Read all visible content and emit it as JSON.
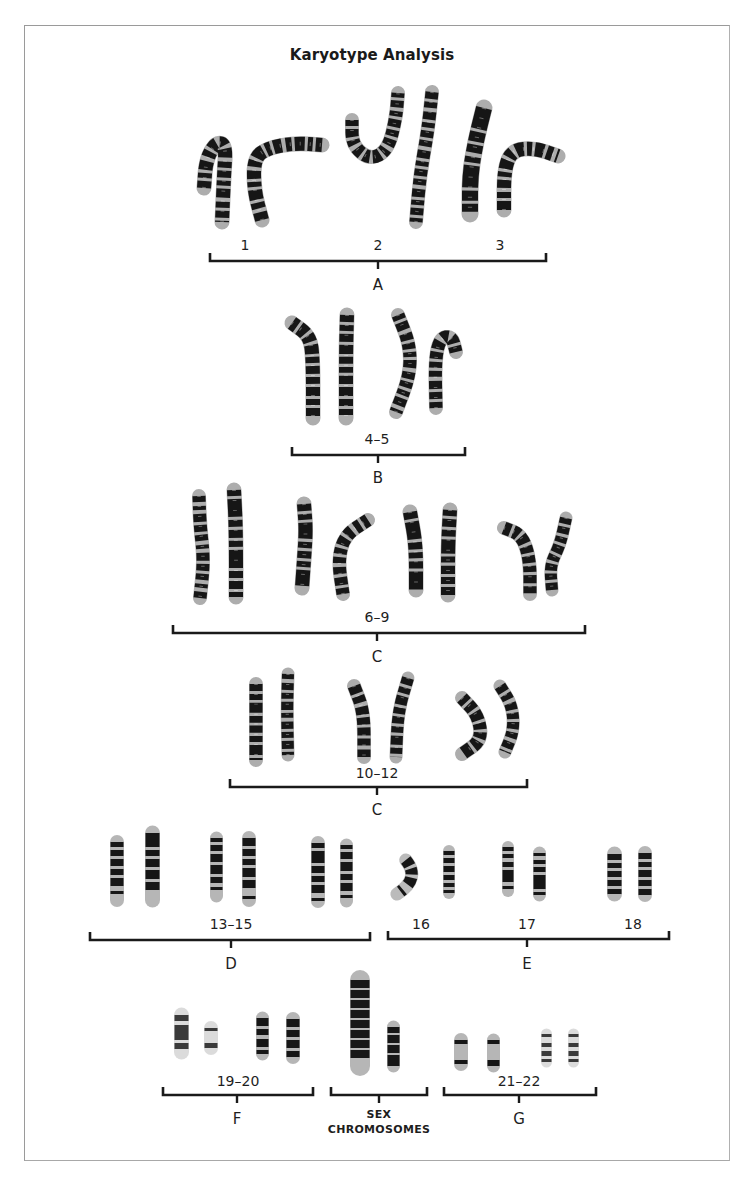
{
  "title": "Karyotype Analysis",
  "colors": {
    "ink": "#161616",
    "frame": "#9a9a9a",
    "background": "#ffffff",
    "light_band": "#d8d8d8"
  },
  "groups": [
    {
      "id": "A",
      "group_label": "A",
      "bracket": {
        "x1": 210,
        "x2": 546,
        "y": 261
      },
      "group_label_pos": {
        "x": 378,
        "y": 277
      },
      "sublabels": [
        {
          "text": "1",
          "x": 245,
          "y": 237
        },
        {
          "text": "2",
          "x": 378,
          "y": 237
        },
        {
          "text": "3",
          "x": 500,
          "y": 237
        }
      ]
    },
    {
      "id": "B",
      "group_label": "B",
      "bracket": {
        "x1": 292,
        "x2": 465,
        "y": 455
      },
      "group_label_pos": {
        "x": 378,
        "y": 470
      },
      "sublabels": [
        {
          "text": "4–5",
          "x": 377,
          "y": 431
        }
      ]
    },
    {
      "id": "C1",
      "group_label": "C",
      "bracket": {
        "x1": 173,
        "x2": 585,
        "y": 633
      },
      "group_label_pos": {
        "x": 377,
        "y": 649
      },
      "sublabels": [
        {
          "text": "6–9",
          "x": 377,
          "y": 609
        }
      ]
    },
    {
      "id": "C2",
      "group_label": "C",
      "bracket": {
        "x1": 230,
        "x2": 527,
        "y": 787
      },
      "group_label_pos": {
        "x": 377,
        "y": 802
      },
      "sublabels": [
        {
          "text": "10–12",
          "x": 377,
          "y": 765
        }
      ]
    },
    {
      "id": "D",
      "group_label": "D",
      "bracket": {
        "x1": 90,
        "x2": 370,
        "y": 940
      },
      "group_label_pos": {
        "x": 231,
        "y": 956
      },
      "sublabels": [
        {
          "text": "13–15",
          "x": 231,
          "y": 916
        }
      ]
    },
    {
      "id": "E",
      "group_label": "E",
      "bracket": {
        "x1": 388,
        "x2": 669,
        "y": 939
      },
      "group_label_pos": {
        "x": 527,
        "y": 956
      },
      "sublabels": [
        {
          "text": "16",
          "x": 421,
          "y": 916
        },
        {
          "text": "17",
          "x": 527,
          "y": 916
        },
        {
          "text": "18",
          "x": 633,
          "y": 916
        }
      ]
    },
    {
      "id": "F",
      "group_label": "F",
      "bracket": {
        "x1": 163,
        "x2": 313,
        "y": 1095
      },
      "group_label_pos": {
        "x": 237,
        "y": 1111
      },
      "sublabels": [
        {
          "text": "19–20",
          "x": 238,
          "y": 1073
        }
      ]
    },
    {
      "id": "SEX",
      "group_label": "SEX\nCHROMOSOMES",
      "group_label_line1": "SEX",
      "group_label_line2": "CHROMOSOMES",
      "bracket": {
        "x1": 331,
        "x2": 427,
        "y": 1095
      },
      "group_label_pos": {
        "x": 379,
        "y": 1108
      },
      "sublabels": []
    },
    {
      "id": "G",
      "group_label": "G",
      "bracket": {
        "x1": 444,
        "x2": 596,
        "y": 1095
      },
      "group_label_pos": {
        "x": 519,
        "y": 1111
      },
      "sublabels": [
        {
          "text": "21–22",
          "x": 519,
          "y": 1073
        }
      ]
    }
  ],
  "chromosomes": [
    {
      "group": "A",
      "name": "1a",
      "w": 15,
      "pts": [
        [
          204,
          188
        ],
        [
          206,
          160
        ],
        [
          216,
          142
        ],
        [
          226,
          145
        ],
        [
          224,
          175
        ],
        [
          222,
          222
        ]
      ],
      "bands": "7 3 5 3 9 4 6 3"
    },
    {
      "group": "A",
      "name": "1b",
      "w": 15,
      "pts": [
        [
          262,
          220
        ],
        [
          254,
          190
        ],
        [
          254,
          158
        ],
        [
          268,
          148
        ],
        [
          295,
          143
        ],
        [
          322,
          145
        ]
      ],
      "bands": "8 4 6 3 10 3 5 3"
    },
    {
      "group": "A",
      "name": "2a",
      "w": 14,
      "pts": [
        [
          352,
          120
        ],
        [
          352,
          145
        ],
        [
          370,
          160
        ],
        [
          388,
          150
        ],
        [
          396,
          118
        ],
        [
          398,
          93
        ]
      ],
      "bands": "6 3 8 3 5 4 7 3"
    },
    {
      "group": "A",
      "name": "2b",
      "w": 14,
      "pts": [
        [
          432,
          92
        ],
        [
          428,
          130
        ],
        [
          420,
          175
        ],
        [
          416,
          222
        ]
      ],
      "bands": "7 3 6 4 8 3 5 3"
    },
    {
      "group": "A",
      "name": "3a",
      "w": 17,
      "pts": [
        [
          484,
          108
        ],
        [
          476,
          140
        ],
        [
          470,
          175
        ],
        [
          470,
          214
        ]
      ],
      "bands": "22 3 10 3 8 4 6 3"
    },
    {
      "group": "A",
      "name": "3b",
      "w": 15,
      "pts": [
        [
          504,
          210
        ],
        [
          504,
          170
        ],
        [
          512,
          150
        ],
        [
          535,
          148
        ],
        [
          558,
          156
        ]
      ],
      "bands": "9 3 6 4 8 3 5 3"
    },
    {
      "group": "B",
      "name": "4a",
      "w": 15,
      "pts": [
        [
          292,
          323
        ],
        [
          310,
          336
        ],
        [
          313,
          360
        ],
        [
          313,
          418
        ]
      ],
      "bands": "6 3 8 3 7 3 9 3"
    },
    {
      "group": "B",
      "name": "4b",
      "w": 15,
      "pts": [
        [
          347,
          315
        ],
        [
          346,
          350
        ],
        [
          346,
          418
        ]
      ],
      "bands": "7 3 6 3 8 3 9 3"
    },
    {
      "group": "B",
      "name": "5a",
      "w": 14,
      "pts": [
        [
          398,
          315
        ],
        [
          410,
          345
        ],
        [
          410,
          375
        ],
        [
          396,
          412
        ]
      ],
      "bands": "5 3 8 4 7 3 6 3"
    },
    {
      "group": "B",
      "name": "5b",
      "w": 14,
      "pts": [
        [
          436,
          408
        ],
        [
          435,
          360
        ],
        [
          440,
          338
        ],
        [
          452,
          336
        ],
        [
          456,
          352
        ]
      ],
      "bands": "6 3 7 3 8 4 6 3"
    },
    {
      "group": "C1",
      "name": "6a",
      "w": 14,
      "pts": [
        [
          199,
          496
        ],
        [
          200,
          525
        ],
        [
          204,
          560
        ],
        [
          200,
          598
        ]
      ],
      "bands": "6 4 4 4 8 3 7 3"
    },
    {
      "group": "C1",
      "name": "6b",
      "w": 15,
      "pts": [
        [
          234,
          490
        ],
        [
          236,
          530
        ],
        [
          236,
          597
        ]
      ],
      "bands": "6 3 18 3 7 3 8 3"
    },
    {
      "group": "C1",
      "name": "7a",
      "w": 15,
      "pts": [
        [
          304,
          504
        ],
        [
          306,
          530
        ],
        [
          304,
          560
        ],
        [
          302,
          588
        ]
      ],
      "bands": "7 3 6 3 16 3 6 3"
    },
    {
      "group": "C1",
      "name": "7b",
      "w": 14,
      "pts": [
        [
          343,
          594
        ],
        [
          338,
          560
        ],
        [
          345,
          535
        ],
        [
          368,
          520
        ]
      ],
      "bands": "6 3 8 3 7 4 6 3"
    },
    {
      "group": "C1",
      "name": "8a",
      "w": 15,
      "pts": [
        [
          410,
          512
        ],
        [
          416,
          545
        ],
        [
          416,
          590
        ]
      ],
      "bands": "7 3 18 3 7 3 6 3"
    },
    {
      "group": "C1",
      "name": "8b",
      "w": 15,
      "pts": [
        [
          450,
          510
        ],
        [
          448,
          545
        ],
        [
          448,
          595
        ]
      ],
      "bands": "6 3 8 3 7 3 14 3"
    },
    {
      "group": "C1",
      "name": "9a",
      "w": 14,
      "pts": [
        [
          504,
          528
        ],
        [
          522,
          535
        ],
        [
          530,
          560
        ],
        [
          530,
          594
        ]
      ],
      "bands": "7 3 6 3 8 3 7 3"
    },
    {
      "group": "C1",
      "name": "9b",
      "w": 13,
      "pts": [
        [
          566,
          518
        ],
        [
          560,
          545
        ],
        [
          550,
          565
        ],
        [
          552,
          590
        ]
      ],
      "bands": "6 3 7 3 6 3 8 3"
    },
    {
      "group": "C2",
      "name": "10a",
      "w": 14,
      "pts": [
        [
          256,
          684
        ],
        [
          256,
          715
        ],
        [
          256,
          760
        ]
      ],
      "bands": "7 3 6 3 10 3 7 3"
    },
    {
      "group": "C2",
      "name": "10b",
      "w": 13,
      "pts": [
        [
          288,
          674
        ],
        [
          287,
          710
        ],
        [
          288,
          755
        ]
      ],
      "bands": "5 4 7 3 6 3 8 3"
    },
    {
      "group": "C2",
      "name": "11a",
      "w": 14,
      "pts": [
        [
          354,
          686
        ],
        [
          364,
          712
        ],
        [
          364,
          757
        ]
      ],
      "bands": "8 3 7 4 8 3 7 3"
    },
    {
      "group": "C2",
      "name": "11b",
      "w": 13,
      "pts": [
        [
          408,
          678
        ],
        [
          398,
          712
        ],
        [
          396,
          757
        ]
      ],
      "bands": "7 3 6 3 9 3 6 3"
    },
    {
      "group": "C2",
      "name": "12a",
      "w": 14,
      "pts": [
        [
          462,
          698
        ],
        [
          478,
          715
        ],
        [
          482,
          740
        ],
        [
          462,
          754
        ]
      ],
      "bands": "6 3 7 3 9 3 6 3"
    },
    {
      "group": "C2",
      "name": "12b",
      "w": 13,
      "pts": [
        [
          500,
          686
        ],
        [
          512,
          705
        ],
        [
          514,
          730
        ],
        [
          505,
          752
        ]
      ],
      "bands": "7 3 6 4 7 3 6 3"
    }
  ],
  "small_chromosomes": [
    {
      "group": "D",
      "name": "13a",
      "x": 110,
      "y": 842,
      "w": 14,
      "h": 58,
      "bands": "5 3 6 3 7 3 6 3 8"
    },
    {
      "group": "D",
      "name": "13b",
      "x": 145,
      "y": 833,
      "w": 15,
      "h": 67,
      "bands": "14 3 6 3 8 3 9 3 8"
    },
    {
      "group": "D",
      "name": "14a",
      "x": 210,
      "y": 838,
      "w": 13,
      "h": 58,
      "bands": "4 3 6 3 8 3 9 3 6"
    },
    {
      "group": "D",
      "name": "14b",
      "x": 242,
      "y": 838,
      "w": 14,
      "h": 62,
      "bands": "8 3 7 3 6 3 9 3 8"
    },
    {
      "group": "D",
      "name": "15a",
      "x": 311,
      "y": 843,
      "w": 14,
      "h": 58,
      "bands": "5 3 12 3 7 3 6 3 8"
    },
    {
      "group": "D",
      "name": "15b",
      "x": 340,
      "y": 845,
      "w": 13,
      "h": 56,
      "bands": "4 3 7 3 9 3 6 3 8"
    },
    {
      "group": "E",
      "name": "16a",
      "x": 397,
      "y": 860,
      "w": 22,
      "h": 34,
      "bands": "7 3 6 3 8",
      "curved": true
    },
    {
      "group": "E",
      "name": "16b",
      "x": 443,
      "y": 851,
      "w": 12,
      "h": 42,
      "bands": "4 3 5 3 6 3 5 3"
    },
    {
      "group": "E",
      "name": "17a",
      "x": 502,
      "y": 847,
      "w": 12,
      "h": 44,
      "bands": "4 3 4 4 5 3 12"
    },
    {
      "group": "E",
      "name": "17b",
      "x": 533,
      "y": 853,
      "w": 13,
      "h": 42,
      "bands": "3 4 4 3 5 3 14"
    },
    {
      "group": "E",
      "name": "18a",
      "x": 607,
      "y": 854,
      "w": 15,
      "h": 40,
      "bands": "6 3 5 3 6 3 6 3"
    },
    {
      "group": "E",
      "name": "18b",
      "x": 638,
      "y": 853,
      "w": 14,
      "h": 42,
      "bands": "6 3 5 3 7 3 6 3"
    },
    {
      "group": "F",
      "name": "19a",
      "x": 174,
      "y": 1015,
      "w": 15,
      "h": 37,
      "bands": "6 4 15 3 6",
      "light": true
    },
    {
      "group": "F",
      "name": "19b",
      "x": 204,
      "y": 1028,
      "w": 14,
      "h": 20,
      "bands": "3 12 5",
      "light": true
    },
    {
      "group": "F",
      "name": "20a",
      "x": 256,
      "y": 1018,
      "w": 13,
      "h": 36,
      "bands": "8 3 6 4 8 3 4"
    },
    {
      "group": "F",
      "name": "20b",
      "x": 286,
      "y": 1019,
      "w": 14,
      "h": 38,
      "bands": "8 3 7 3 8 3 6"
    },
    {
      "group": "SEX",
      "name": "X",
      "x": 350,
      "y": 980,
      "w": 20,
      "h": 86,
      "bands": "8 2 8 2 8 2 8 2 8 2 8 2 8 2 8"
    },
    {
      "group": "SEX",
      "name": "Y",
      "x": 387,
      "y": 1027,
      "w": 13,
      "h": 39,
      "bands": "6 2 8 2 8 2 11"
    },
    {
      "group": "G",
      "name": "21a",
      "x": 454,
      "y": 1040,
      "w": 14,
      "h": 24,
      "bands": "4 16 4"
    },
    {
      "group": "G",
      "name": "21b",
      "x": 487,
      "y": 1040,
      "w": 13,
      "h": 26,
      "bands": "4 16 6"
    },
    {
      "group": "G",
      "name": "22a",
      "x": 541,
      "y": 1034,
      "w": 11,
      "h": 28,
      "bands": "3 6 4 4 5 3",
      "light": true
    },
    {
      "group": "G",
      "name": "22b",
      "x": 568,
      "y": 1034,
      "w": 11,
      "h": 28,
      "bands": "3 6 4 4 5 3",
      "light": true
    }
  ]
}
